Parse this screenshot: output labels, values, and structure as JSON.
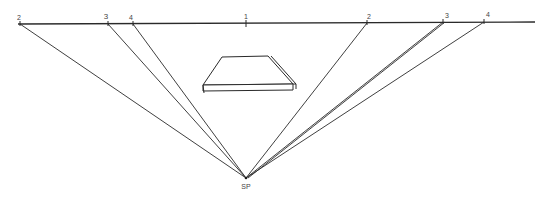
{
  "diagram": {
    "type": "perspective-drawing",
    "horizon_line": {
      "x1": 18,
      "y1": 24,
      "x2": 535,
      "y2": 22
    },
    "station_point": {
      "label": "SP",
      "x": 246,
      "y": 178
    },
    "center_mark": {
      "label": "1",
      "x": 246,
      "y": 23
    },
    "points": [
      {
        "label": "2",
        "x": 20,
        "y": 24,
        "label_x": 19,
        "label_y": 14
      },
      {
        "label": "3",
        "x": 108,
        "y": 24,
        "label_x": 106,
        "label_y": 13
      },
      {
        "label": "4",
        "x": 133,
        "y": 24,
        "label_x": 131,
        "label_y": 14
      },
      {
        "label": "2",
        "x": 367,
        "y": 23,
        "label_x": 369,
        "label_y": 13
      },
      {
        "label": "3",
        "x": 443,
        "y": 22,
        "label_x": 447,
        "label_y": 12
      },
      {
        "label": "4",
        "x": 484,
        "y": 22,
        "label_x": 488,
        "label_y": 11
      }
    ],
    "object": {
      "name": "slab",
      "top_back_left": [
        222,
        57
      ],
      "top_back_right": [
        268,
        56
      ],
      "front_left": [
        203,
        85
      ],
      "front_right": [
        293,
        84
      ],
      "thickness": 6
    },
    "colors": {
      "line": "#2a2a2a",
      "label": "#444444",
      "background": "#ffffff"
    }
  },
  "labels": {
    "sp": "SP",
    "center": "1",
    "p2_left": "2",
    "p3_left": "3",
    "p4_left": "4",
    "p2_right": "2",
    "p3_right": "3",
    "p4_right": "4"
  }
}
